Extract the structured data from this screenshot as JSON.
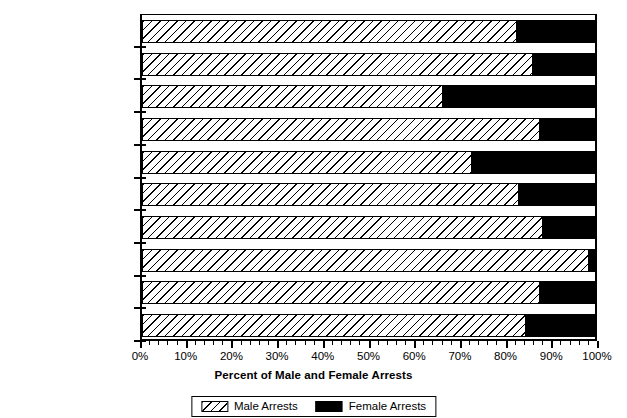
{
  "chart_data": {
    "type": "bar",
    "orientation": "horizontal",
    "stacked": true,
    "title": "",
    "xlabel": "Percent of Male and Female Arrests",
    "ylabel": "",
    "xlim": [
      0,
      100
    ],
    "grid": false,
    "legend_position": "bottom",
    "xticks": [
      "0%",
      "10%",
      "20%",
      "30%",
      "40%",
      "50%",
      "60%",
      "70%",
      "80%",
      "90%",
      "100%"
    ],
    "xtick_values": [
      0,
      10,
      20,
      30,
      40,
      50,
      60,
      70,
      80,
      90,
      100
    ],
    "minor_tick_step": 2,
    "categories": [
      "Arson",
      "Motor Vehicle Theft",
      "Larceny-Theft",
      "Burglary",
      "Property Crimes",
      "Aggravated Assault",
      "Robbery",
      "Forcible Rape",
      "Murder",
      "Violent Crimes"
    ],
    "series": [
      {
        "name": "Male Arrests",
        "pattern": "diagonal-hatch",
        "color": "#ffffff",
        "values": [
          82.5,
          86.0,
          66.3,
          87.7,
          72.6,
          83.1,
          88.2,
          98.5,
          87.7,
          84.5
        ]
      },
      {
        "name": "Female Arrests",
        "pattern": "solid",
        "color": "#000000",
        "values": [
          17.5,
          14.0,
          33.7,
          12.3,
          27.4,
          16.9,
          11.8,
          1.5,
          12.3,
          15.5
        ]
      }
    ]
  },
  "legend": {
    "entries": [
      {
        "label": "Male Arrests",
        "swatch": "hatched-swatch"
      },
      {
        "label": "Female Arrests",
        "swatch": "black-swatch"
      }
    ]
  }
}
